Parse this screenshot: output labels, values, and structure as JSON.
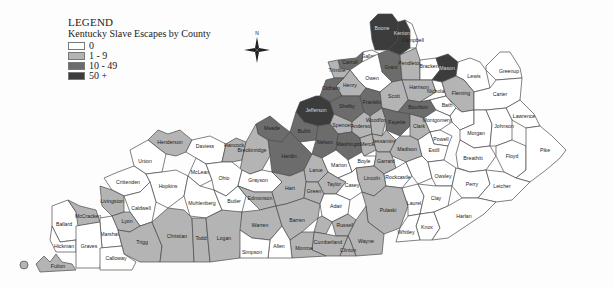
{
  "legend": {
    "title": "LEGEND",
    "subtitle": "Kentucky Slave Escapes by County",
    "items": [
      {
        "label": "0",
        "color": "#ffffff"
      },
      {
        "label": "1 - 9",
        "color": "#b4b4b4"
      },
      {
        "label": "10 - 49",
        "color": "#6c6c6c"
      },
      {
        "label": "50 +",
        "color": "#3c3c3c"
      }
    ]
  },
  "compass": {
    "label": "N",
    "icon": "compass-rose-icon"
  },
  "map": {
    "title": "Kentucky Slave Escapes by County",
    "counties": [
      {
        "name": "Boone",
        "class": "50 +"
      },
      {
        "name": "Kenton",
        "class": "50 +"
      },
      {
        "name": "Campbell",
        "class": "0"
      },
      {
        "name": "Gallatin",
        "class": "0"
      },
      {
        "name": "Grant",
        "class": "10 - 49"
      },
      {
        "name": "Pendleton",
        "class": "1 - 9"
      },
      {
        "name": "Bracken",
        "class": "0"
      },
      {
        "name": "Mason",
        "class": "50 +"
      },
      {
        "name": "Lewis",
        "class": "0"
      },
      {
        "name": "Greenup",
        "class": "0"
      },
      {
        "name": "Carroll",
        "class": "10 - 49"
      },
      {
        "name": "Trimble",
        "class": "1 - 9"
      },
      {
        "name": "Owen",
        "class": "0"
      },
      {
        "name": "Henry",
        "class": "1 - 9"
      },
      {
        "name": "Harrison",
        "class": "1 - 9"
      },
      {
        "name": "Nicholas",
        "class": "0"
      },
      {
        "name": "Fleming",
        "class": "1 - 9"
      },
      {
        "name": "Carter",
        "class": "0"
      },
      {
        "name": "Oldham",
        "class": "10 - 49"
      },
      {
        "name": "Jefferson",
        "class": "50 +"
      },
      {
        "name": "Shelby",
        "class": "10 - 49"
      },
      {
        "name": "Franklin",
        "class": "10 - 49"
      },
      {
        "name": "Scott",
        "class": "1 - 9"
      },
      {
        "name": "Bourbon",
        "class": "10 - 49"
      },
      {
        "name": "Bath",
        "class": "0"
      },
      {
        "name": "Rowan",
        "class": "0"
      },
      {
        "name": "Lawrence",
        "class": "0"
      },
      {
        "name": "Spencer",
        "class": "1 - 9"
      },
      {
        "name": "Anderson",
        "class": "1 - 9"
      },
      {
        "name": "Woodford",
        "class": "1 - 9"
      },
      {
        "name": "Fayette",
        "class": "10 - 49"
      },
      {
        "name": "Clark",
        "class": "1 - 9"
      },
      {
        "name": "Montgomery",
        "class": "0"
      },
      {
        "name": "Morgan",
        "class": "0"
      },
      {
        "name": "Johnson",
        "class": "0"
      },
      {
        "name": "Meade",
        "class": "10 - 49"
      },
      {
        "name": "Bullitt",
        "class": "10 - 49"
      },
      {
        "name": "Nelson",
        "class": "10 - 49"
      },
      {
        "name": "Hardin",
        "class": "10 - 49"
      },
      {
        "name": "Washington",
        "class": "10 - 49"
      },
      {
        "name": "Mercer",
        "class": "1 - 9"
      },
      {
        "name": "Jessamine",
        "class": "1 - 9"
      },
      {
        "name": "Madison",
        "class": "1 - 9"
      },
      {
        "name": "Powell",
        "class": "0"
      },
      {
        "name": "Estill",
        "class": "0"
      },
      {
        "name": "Breathitt",
        "class": "0"
      },
      {
        "name": "Floyd",
        "class": "0"
      },
      {
        "name": "Pike",
        "class": "0"
      },
      {
        "name": "Henderson",
        "class": "1 - 9"
      },
      {
        "name": "Daviess",
        "class": "0"
      },
      {
        "name": "Hancock",
        "class": "1 - 9"
      },
      {
        "name": "Breckinridge",
        "class": "1 - 9"
      },
      {
        "name": "Union",
        "class": "0"
      },
      {
        "name": "McLean",
        "class": "0"
      },
      {
        "name": "Ohio",
        "class": "0"
      },
      {
        "name": "Grayson",
        "class": "0"
      },
      {
        "name": "Larue",
        "class": "1 - 9"
      },
      {
        "name": "Marion",
        "class": "0"
      },
      {
        "name": "Boyle",
        "class": "0"
      },
      {
        "name": "Garrard",
        "class": "1 - 9"
      },
      {
        "name": "Lincoln",
        "class": "1 - 9"
      },
      {
        "name": "Rockcastle",
        "class": "0"
      },
      {
        "name": "Jackson",
        "class": "0"
      },
      {
        "name": "Owsley",
        "class": "0"
      },
      {
        "name": "Perry",
        "class": "0"
      },
      {
        "name": "Letcher",
        "class": "0"
      },
      {
        "name": "Crittenden",
        "class": "0"
      },
      {
        "name": "Hopkins",
        "class": "0"
      },
      {
        "name": "Livingston",
        "class": "1 - 9"
      },
      {
        "name": "Caldwell",
        "class": "0"
      },
      {
        "name": "Lyon",
        "class": "1 - 9"
      },
      {
        "name": "Muhlenberg",
        "class": "0"
      },
      {
        "name": "Butler",
        "class": "0"
      },
      {
        "name": "Edmonson",
        "class": "1 - 9"
      },
      {
        "name": "Hart",
        "class": "1 - 9"
      },
      {
        "name": "Green",
        "class": "1 - 9"
      },
      {
        "name": "Taylor",
        "class": "1 - 9"
      },
      {
        "name": "Casey",
        "class": "0"
      },
      {
        "name": "Adair",
        "class": "0"
      },
      {
        "name": "Pulaski",
        "class": "1 - 9"
      },
      {
        "name": "Laurel",
        "class": "0"
      },
      {
        "name": "Clay",
        "class": "0"
      },
      {
        "name": "Knox",
        "class": "0"
      },
      {
        "name": "Harlan",
        "class": "0"
      },
      {
        "name": "Whitley",
        "class": "0"
      },
      {
        "name": "Ballard",
        "class": "0"
      },
      {
        "name": "McCracken",
        "class": "1 - 9"
      },
      {
        "name": "Marshall",
        "class": "0"
      },
      {
        "name": "Trigg",
        "class": "1 - 9"
      },
      {
        "name": "Christian",
        "class": "1 - 9"
      },
      {
        "name": "Todd",
        "class": "1 - 9"
      },
      {
        "name": "Logan",
        "class": "1 - 9"
      },
      {
        "name": "Warren",
        "class": "1 - 9"
      },
      {
        "name": "Barren",
        "class": "1 - 9"
      },
      {
        "name": "Metcalfe",
        "class": "1 - 9"
      },
      {
        "name": "Russell",
        "class": "1 - 9"
      },
      {
        "name": "Wayne",
        "class": "1 - 9"
      },
      {
        "name": "Cumberland",
        "class": "1 - 9"
      },
      {
        "name": "Clinton",
        "class": "1 - 9"
      },
      {
        "name": "Monroe",
        "class": "1 - 9"
      },
      {
        "name": "Allen",
        "class": "0"
      },
      {
        "name": "Simpson",
        "class": "0"
      },
      {
        "name": "Hickman",
        "class": "0"
      },
      {
        "name": "Graves",
        "class": "0"
      },
      {
        "name": "Calloway",
        "class": "0"
      },
      {
        "name": "Fulton",
        "class": "1 - 9"
      }
    ]
  }
}
